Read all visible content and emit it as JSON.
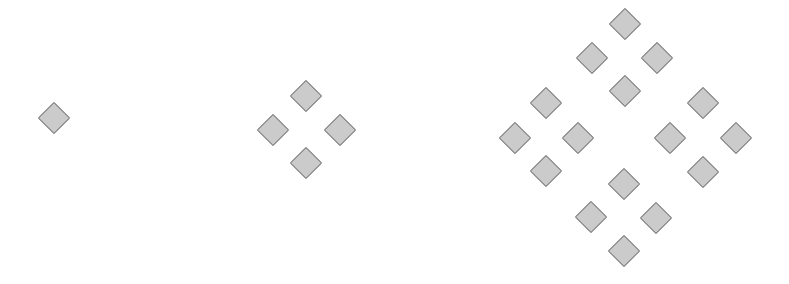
{
  "diagram": {
    "type": "fractal-iterations",
    "colors": {
      "background": "#ffffff",
      "diamond_fill": "#cbcbcb",
      "diamond_stroke": "#7b7b7b"
    },
    "diamond_size": 23,
    "stages": [
      {
        "name": "iteration-0",
        "count": 1,
        "centers": [
          [
            54,
            118
          ]
        ]
      },
      {
        "name": "iteration-1",
        "count": 4,
        "centers": [
          [
            306,
            96
          ],
          [
            273,
            130
          ],
          [
            340,
            130
          ],
          [
            306,
            163
          ]
        ]
      },
      {
        "name": "iteration-2",
        "count": 16,
        "centers": [
          [
            625,
            24
          ],
          [
            592,
            58
          ],
          [
            657,
            58
          ],
          [
            625,
            91
          ],
          [
            546,
            103
          ],
          [
            515,
            138
          ],
          [
            578,
            138
          ],
          [
            546,
            171
          ],
          [
            703,
            103
          ],
          [
            670,
            138
          ],
          [
            736,
            138
          ],
          [
            703,
            172
          ],
          [
            624,
            184
          ],
          [
            591,
            217
          ],
          [
            656,
            218
          ],
          [
            624,
            251
          ]
        ]
      }
    ]
  }
}
